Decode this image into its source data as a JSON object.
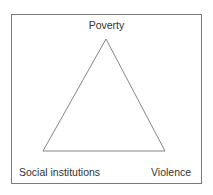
{
  "diagram": {
    "type": "triangle",
    "nodes": [
      {
        "id": "top",
        "label": "Poverty"
      },
      {
        "id": "bottom-left",
        "label": "Social institutions"
      },
      {
        "id": "bottom-right",
        "label": "Violence"
      }
    ],
    "edges": [
      [
        "top",
        "bottom-left"
      ],
      [
        "top",
        "bottom-right"
      ],
      [
        "bottom-left",
        "bottom-right"
      ]
    ]
  }
}
